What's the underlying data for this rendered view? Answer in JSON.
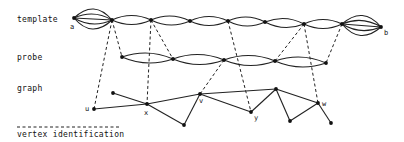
{
  "labels": {
    "template": "template",
    "probe": "probe",
    "graph": "graph",
    "legend": "vertex identification"
  },
  "vertex_labels": {
    "a": "a",
    "b": "b",
    "u": "u",
    "x": "x",
    "v": "v",
    "y": "y",
    "w": "w"
  },
  "colors": {
    "ink": "#222222",
    "background": "#ffffff"
  },
  "template": {
    "nodes": [
      {
        "id": "a",
        "x": 74,
        "y": 18
      },
      {
        "id": "t1",
        "x": 112,
        "y": 20
      },
      {
        "id": "t2",
        "x": 151,
        "y": 20
      },
      {
        "id": "t3",
        "x": 190,
        "y": 21
      },
      {
        "id": "t4",
        "x": 228,
        "y": 21
      },
      {
        "id": "t5",
        "x": 265,
        "y": 22
      },
      {
        "id": "t6",
        "x": 304,
        "y": 24
      },
      {
        "id": "t7",
        "x": 342,
        "y": 24
      },
      {
        "id": "b",
        "x": 381,
        "y": 27
      }
    ],
    "multi_edge_bundles": [
      {
        "from": "a",
        "to": "t1",
        "count": 5
      },
      {
        "from": "t7",
        "to": "b",
        "count": 5
      }
    ],
    "double_edges": [
      [
        "t1",
        "t2"
      ],
      [
        "t2",
        "t3"
      ],
      [
        "t3",
        "t4"
      ],
      [
        "t4",
        "t5"
      ],
      [
        "t5",
        "t6"
      ],
      [
        "t6",
        "t7"
      ]
    ]
  },
  "probe": {
    "nodes": [
      {
        "id": "p1",
        "x": 122,
        "y": 57
      },
      {
        "id": "p2",
        "x": 173,
        "y": 59
      },
      {
        "id": "p3",
        "x": 224,
        "y": 60
      },
      {
        "id": "p4",
        "x": 275,
        "y": 61
      },
      {
        "id": "p5",
        "x": 326,
        "y": 63
      }
    ],
    "double_edges": [
      [
        "p1",
        "p2"
      ],
      [
        "p2",
        "p3"
      ],
      [
        "p3",
        "p4"
      ],
      [
        "p4",
        "p5"
      ]
    ]
  },
  "graph": {
    "nodes": [
      {
        "id": "u",
        "x": 94,
        "y": 109
      },
      {
        "id": "g1",
        "x": 113,
        "y": 93
      },
      {
        "id": "x",
        "x": 147,
        "y": 104
      },
      {
        "id": "g2",
        "x": 184,
        "y": 125
      },
      {
        "id": "v",
        "x": 200,
        "y": 94
      },
      {
        "id": "y",
        "x": 251,
        "y": 112
      },
      {
        "id": "g3",
        "x": 276,
        "y": 89
      },
      {
        "id": "g4",
        "x": 290,
        "y": 121
      },
      {
        "id": "w",
        "x": 318,
        "y": 103
      },
      {
        "id": "g5",
        "x": 331,
        "y": 123
      }
    ],
    "edges": [
      [
        "u",
        "x"
      ],
      [
        "g1",
        "x"
      ],
      [
        "x",
        "v"
      ],
      [
        "x",
        "g2"
      ],
      [
        "v",
        "g2"
      ],
      [
        "v",
        "y"
      ],
      [
        "v",
        "g3"
      ],
      [
        "y",
        "g3"
      ],
      [
        "g3",
        "g4"
      ],
      [
        "g4",
        "w"
      ],
      [
        "g3",
        "w"
      ],
      [
        "w",
        "g5"
      ]
    ]
  },
  "identifications": [
    [
      "t1",
      "u"
    ],
    [
      "t1",
      "p1"
    ],
    [
      "t2",
      "x"
    ],
    [
      "t2",
      "p2"
    ],
    [
      "t4",
      "y"
    ],
    [
      "p3",
      "v"
    ],
    [
      "t6",
      "p4"
    ],
    [
      "t6",
      "w"
    ],
    [
      "t7",
      "p5"
    ]
  ]
}
